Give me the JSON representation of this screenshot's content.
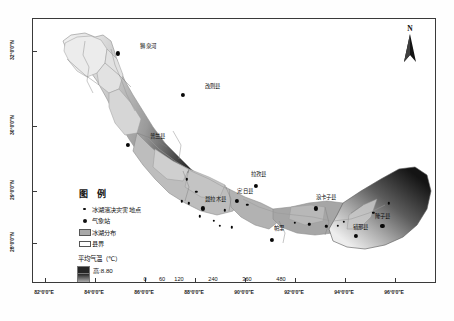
{
  "figure": {
    "kind": "thematic-map",
    "region": "Tibet Himalaya glacial lake belt"
  },
  "north_arrow": {
    "letter": "N",
    "name": "north-arrow"
  },
  "legend": {
    "title": "图 例",
    "items": [
      {
        "key": "dot-small",
        "label": "冰湖溃决灾害地点"
      },
      {
        "key": "dot-big",
        "label": "气象站"
      },
      {
        "key": "swatch-gray",
        "label": "冰湖分布"
      },
      {
        "key": "swatch-white",
        "label": "县界"
      }
    ],
    "temperature": {
      "title": "平均气温（℃）",
      "high_label": "高:8.80",
      "low_label": "低:-0.04",
      "high_value": 8.8,
      "low_value": -0.04,
      "high_color": "#262626",
      "low_color": "#f0f0f0"
    }
  },
  "scalebar": {
    "ticks": [
      "0",
      "60",
      "120",
      "240",
      "360",
      "480"
    ],
    "tick_values": [
      0,
      60,
      120,
      240,
      360,
      480
    ],
    "unit": "km"
  },
  "axes": {
    "longitude": [
      {
        "label": "82°0'0\"E",
        "value": 82
      },
      {
        "label": "84°0'0\"E",
        "value": 84
      },
      {
        "label": "86°0'0\"E",
        "value": 86
      },
      {
        "label": "88°0'0\"E",
        "value": 88
      },
      {
        "label": "90°0'0\"E",
        "value": 90
      },
      {
        "label": "92°0'0\"E",
        "value": 92
      },
      {
        "label": "94°0'0\"E",
        "value": 94
      },
      {
        "label": "96°0'0\"E",
        "value": 96
      }
    ],
    "latitude": [
      {
        "label": "32°0'0\"N",
        "value": 32
      },
      {
        "label": "30°0'0\"N",
        "value": 30
      },
      {
        "label": "29°0'0\"N",
        "value": 29
      },
      {
        "label": "28°0'0\"N",
        "value": 28
      }
    ]
  },
  "stations": [
    {
      "name": "狮泉河",
      "x": 21.0,
      "y": 13.0,
      "lx": 28.5,
      "ly": 10.0
    },
    {
      "name": "改则县",
      "x": 37.2,
      "y": 28.5,
      "lx": 44.5,
      "ly": 25.3
    },
    {
      "name": "普兰县",
      "x": 23.5,
      "y": 47.5,
      "lx": 30.8,
      "ly": 44.3
    },
    {
      "name": "聂拉木县",
      "x": 42.0,
      "y": 71.5,
      "lx": 45.2,
      "ly": 68.0
    },
    {
      "name": "定日县",
      "x": 50.5,
      "y": 68.5,
      "lx": 52.5,
      "ly": 65.0
    },
    {
      "name": "拉孜县",
      "x": 55.2,
      "y": 63.0,
      "lx": 55.8,
      "ly": 58.5
    },
    {
      "name": "帕里",
      "x": 59.2,
      "y": 83.5,
      "lx": 60.8,
      "ly": 79.0
    },
    {
      "name": "浪卡子县",
      "x": 70.0,
      "y": 71.5,
      "lx": 72.5,
      "ly": 67.0
    },
    {
      "name": "错那县",
      "x": 80.0,
      "y": 82.0,
      "lx": 81.0,
      "ly": 78.5
    },
    {
      "name": "隆子县",
      "x": 86.5,
      "y": 78.0,
      "lx": 86.5,
      "ly": 74.2
    }
  ],
  "disaster_points": [
    {
      "x": 38.0,
      "y": 60.5
    },
    {
      "x": 40.4,
      "y": 65.2
    },
    {
      "x": 36.8,
      "y": 68.8
    },
    {
      "x": 38.6,
      "y": 69.6
    },
    {
      "x": 41.3,
      "y": 74.5
    },
    {
      "x": 44.8,
      "y": 76.2
    },
    {
      "x": 47.5,
      "y": 72.2
    },
    {
      "x": 46.3,
      "y": 78.0
    },
    {
      "x": 49.2,
      "y": 78.6
    },
    {
      "x": 53.0,
      "y": 70.0
    },
    {
      "x": 64.8,
      "y": 76.8
    },
    {
      "x": 68.4,
      "y": 77.4
    },
    {
      "x": 72.6,
      "y": 78.2
    },
    {
      "x": 75.4,
      "y": 78.0
    },
    {
      "x": 77.0,
      "y": 76.5
    },
    {
      "x": 84.2,
      "y": 73.2
    },
    {
      "x": 88.0,
      "y": 69.5
    }
  ]
}
